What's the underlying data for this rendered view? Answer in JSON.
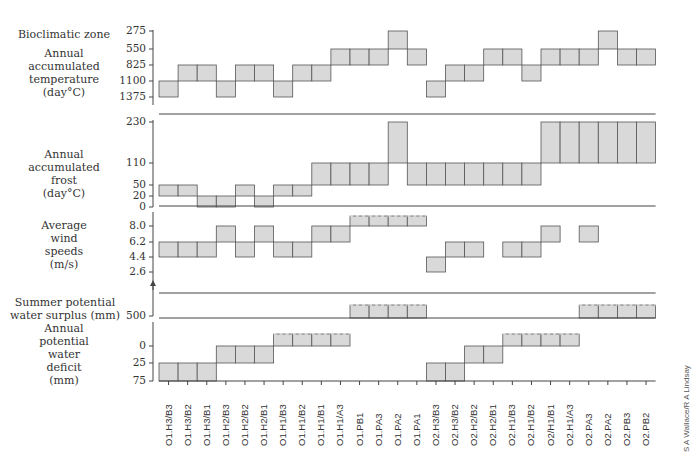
{
  "chart_data": {
    "type": "step-bar-panels",
    "title": "",
    "categories": [
      "O1.H3/B3",
      "O1.H3/B2",
      "O1.H3/B1",
      "O1.H2/B3",
      "O1.H2/B2",
      "O1.H2/B1",
      "O1.H1/B3",
      "O1.H1/B2",
      "O1.H1/B1",
      "O1.H1/A3",
      "O1.PB1",
      "O1.PA3",
      "O1.PA2",
      "O1.PA1",
      "O2.H3/B3",
      "O2.H3/B2",
      "O2.H2/B2",
      "O2.H2/B1",
      "O2.H1/B3",
      "O2.H1/B2",
      "O2/H1/B1",
      "O2.H1/A3",
      "O2.PA3",
      "O2.PA2",
      "O2.PB3",
      "O2.PB2"
    ],
    "xlabel": "Bioclimatic zone",
    "panels": [
      {
        "name": "Annual accumulated temperature (day°C)",
        "ticks": [
          "275",
          "550",
          "825",
          "1100",
          "1375"
        ],
        "ranges_low_high": [
          [
            1100,
            1375
          ],
          [
            825,
            1100
          ],
          [
            825,
            1100
          ],
          [
            1100,
            1375
          ],
          [
            825,
            1100
          ],
          [
            825,
            1100
          ],
          [
            1100,
            1375
          ],
          [
            825,
            1100
          ],
          [
            825,
            1100
          ],
          [
            550,
            825
          ],
          [
            550,
            825
          ],
          [
            550,
            825
          ],
          [
            275,
            550
          ],
          [
            550,
            825
          ],
          [
            1100,
            1375
          ],
          [
            825,
            1100
          ],
          [
            825,
            1100
          ],
          [
            550,
            825
          ],
          [
            550,
            825
          ],
          [
            825,
            1100
          ],
          [
            550,
            825
          ],
          [
            550,
            825
          ],
          [
            550,
            825
          ],
          [
            275,
            550
          ],
          [
            550,
            825
          ],
          [
            550,
            825
          ]
        ]
      },
      {
        "name": "Annual accumulated frost (day°C)",
        "ticks": [
          "230",
          "110",
          "50",
          "20",
          "0"
        ],
        "ranges_low_high": [
          [
            20,
            50
          ],
          [
            20,
            50
          ],
          [
            0,
            20
          ],
          [
            0,
            20
          ],
          [
            20,
            50
          ],
          [
            0,
            20
          ],
          [
            20,
            50
          ],
          [
            20,
            50
          ],
          [
            50,
            110
          ],
          [
            50,
            110
          ],
          [
            50,
            110
          ],
          [
            50,
            110
          ],
          [
            110,
            230
          ],
          [
            50,
            110
          ],
          [
            50,
            110
          ],
          [
            50,
            110
          ],
          [
            50,
            110
          ],
          [
            50,
            110
          ],
          [
            50,
            110
          ],
          [
            50,
            110
          ],
          [
            110,
            230
          ],
          [
            110,
            230
          ],
          [
            110,
            230
          ],
          [
            110,
            230
          ],
          [
            110,
            230
          ],
          [
            110,
            230
          ]
        ]
      },
      {
        "name": "Average wind speeds (m/s)",
        "ticks": [
          "8.0",
          "6.2",
          "4.4",
          "2.6"
        ],
        "ranges_low_high": [
          [
            4.4,
            6.2
          ],
          [
            4.4,
            6.2
          ],
          [
            4.4,
            6.2
          ],
          [
            6.2,
            8.0
          ],
          [
            4.4,
            6.2
          ],
          [
            6.2,
            8.0
          ],
          [
            4.4,
            6.2
          ],
          [
            4.4,
            6.2
          ],
          [
            6.2,
            8.0
          ],
          [
            6.2,
            8.0
          ],
          [
            8.0,
            "open"
          ],
          [
            8.0,
            "open"
          ],
          [
            8.0,
            "open"
          ],
          [
            8.0,
            "open"
          ],
          [
            2.6,
            4.4
          ],
          [
            4.4,
            6.2
          ],
          [
            4.4,
            6.2
          ],
          null,
          [
            4.4,
            6.2
          ],
          [
            4.4,
            6.2
          ],
          [
            6.2,
            8.0
          ],
          null,
          [
            6.2,
            8.0
          ],
          null,
          null,
          null
        ]
      },
      {
        "name": "Summer potential water surplus (mm)",
        "ticks": [
          "500"
        ],
        "present_columns": [
          "O1.PB1",
          "O1.PA3",
          "O1.PA2",
          "O1.PA1",
          "O2.PA3",
          "O2.PA2",
          "O2.PB3",
          "O2.PB2"
        ],
        "note": ">500 (open-ended, dashed top)"
      },
      {
        "name": "Annual potential water deficit (mm)",
        "ticks": [
          "0",
          "25",
          "75"
        ],
        "ranges_low_high": [
          [
            25,
            75
          ],
          [
            25,
            75
          ],
          [
            25,
            75
          ],
          [
            0,
            25
          ],
          [
            0,
            25
          ],
          [
            0,
            25
          ],
          [
            "open",
            0
          ],
          [
            "open",
            0
          ],
          [
            "open",
            0
          ],
          [
            "open",
            0
          ],
          null,
          null,
          null,
          null,
          [
            25,
            75
          ],
          [
            25,
            75
          ],
          [
            0,
            25
          ],
          [
            0,
            25
          ],
          [
            "open",
            0
          ],
          [
            "open",
            0
          ],
          [
            "open",
            0
          ],
          [
            "open",
            0
          ],
          null,
          null,
          null,
          null
        ]
      }
    ],
    "credit": "S A Wallace/R A Lindsay"
  },
  "labels": {
    "zone": "Bioclimatic zone",
    "temp": [
      "Annual",
      "accumulated",
      "temperature",
      "(day°C)"
    ],
    "frost": [
      "Annual",
      "accumulated",
      "frost",
      "(day°C)"
    ],
    "wind": [
      "Average",
      "wind",
      "speeds",
      "(m/s)"
    ],
    "surplus": [
      "Summer potential",
      "water surplus (mm)"
    ],
    "deficit": [
      "Annual",
      "potential",
      "water",
      "deficit",
      "(mm)"
    ]
  },
  "ticks": {
    "temp": [
      "275",
      "550",
      "825",
      "1100",
      "1375"
    ],
    "frost": [
      "230",
      "110",
      "50",
      "20",
      "0"
    ],
    "wind": [
      "8.0",
      "6.2",
      "4.4",
      "2.6"
    ],
    "surplus": [
      "500"
    ],
    "deficit": [
      "0",
      "25",
      "75"
    ]
  },
  "credit": "S A Wallace/R A Lindsay",
  "colors": {
    "fill": "#d9d9d9",
    "stroke": "#555555",
    "axis": "#444444"
  }
}
